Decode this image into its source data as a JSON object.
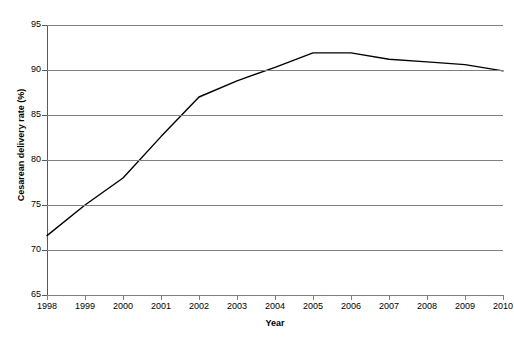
{
  "chart_data": {
    "type": "line",
    "title": "",
    "xlabel": "Year",
    "ylabel": "Cesarean delivery rate (%)",
    "x": [
      1998,
      1999,
      2000,
      2001,
      2002,
      2003,
      2004,
      2005,
      2006,
      2007,
      2008,
      2009,
      2010
    ],
    "categories": [
      "1998",
      "1999",
      "2000",
      "2001",
      "2002",
      "2003",
      "2004",
      "2005",
      "2006",
      "2007",
      "2008",
      "2009",
      "2010"
    ],
    "values": [
      71.6,
      75.0,
      78.0,
      82.6,
      87.0,
      88.8,
      90.3,
      91.9,
      91.9,
      91.2,
      90.9,
      90.6,
      89.9
    ],
    "series": [
      {
        "name": "Cesarean delivery rate",
        "values": [
          71.6,
          75.0,
          78.0,
          82.6,
          87.0,
          88.8,
          90.3,
          91.9,
          91.9,
          91.2,
          90.9,
          90.6,
          89.9
        ]
      }
    ],
    "ylim": [
      65,
      95
    ],
    "yticks": [
      65,
      70,
      75,
      80,
      85,
      90,
      95
    ],
    "ytick_labels": [
      "65",
      "70",
      "75",
      "80",
      "85",
      "90",
      "95"
    ],
    "grid": true,
    "grid_axis": "y",
    "legend": false,
    "legend_position": "none",
    "line_color": "#000000",
    "grid_color": "#808080",
    "axis_color": "#595959",
    "background_color": "#ffffff"
  }
}
